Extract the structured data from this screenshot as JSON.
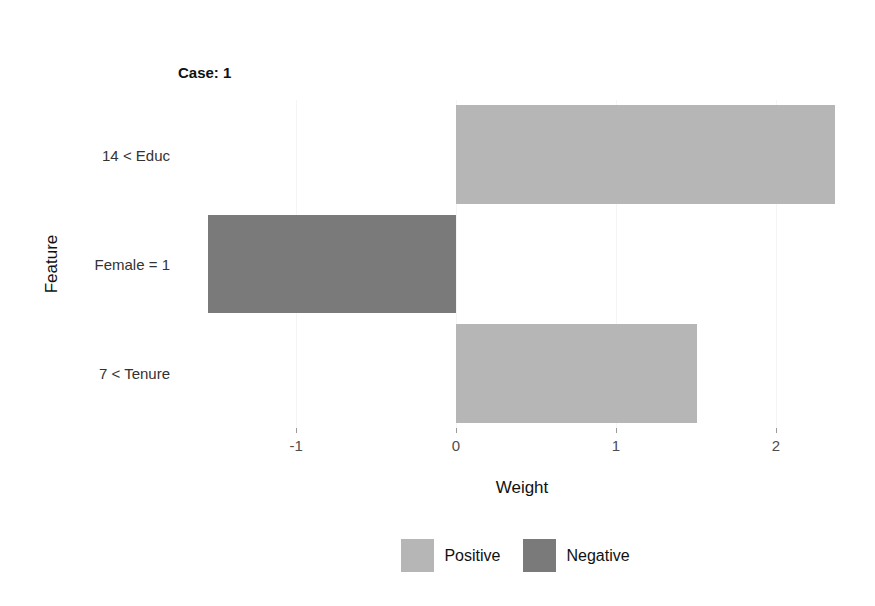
{
  "header": {
    "case": "Case: 1",
    "prediction": "Prediction: 9.23620080622151",
    "explanation_fit": "Explanation Fit: 0.68"
  },
  "chart_data": {
    "type": "bar",
    "orientation": "horizontal",
    "categories": [
      "14 < Educ",
      "Female = 1",
      "7 < Tenure"
    ],
    "values": [
      2.37,
      -1.55,
      1.51
    ],
    "bar_signs": [
      "positive",
      "negative",
      "positive"
    ],
    "xlabel": "Weight",
    "ylabel": "Feature",
    "x_ticks": [
      -1,
      0,
      1,
      2
    ],
    "xlim": [
      -1.745,
      2.57
    ],
    "grid": "faint vertical lines at x ticks",
    "legend_position": "bottom-center",
    "legend": [
      {
        "label": "Positive",
        "color": "#b6b6b6"
      },
      {
        "label": "Negative",
        "color": "#7a7a7a"
      }
    ],
    "colors": {
      "positive": "#b6b6b6",
      "negative": "#7a7a7a",
      "axis_text": "#4d4d4d",
      "category_text": "#333333",
      "title_text": "#111111"
    },
    "bar_width_fraction": 0.9
  }
}
